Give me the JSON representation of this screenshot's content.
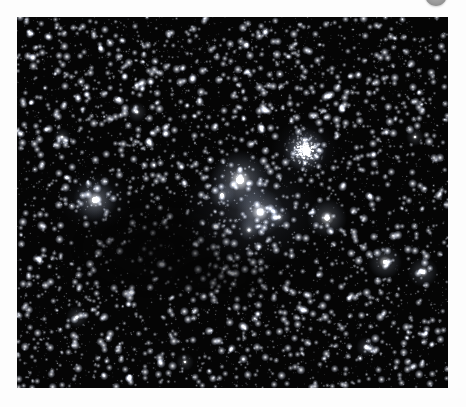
{
  "page": {
    "background_color": "#fdfdfd"
  },
  "avatar_badge": {
    "name": "avatar-badge",
    "shape": "circle",
    "color": "#9a9a9a",
    "clipped": "top"
  },
  "sky_image": {
    "alt": "Dense Milky Way star field with globular cluster and dark nebulae",
    "background_color": "#050505",
    "frame": {
      "x": 17,
      "y": 17,
      "width": 431,
      "height": 371
    },
    "star_color": "#ffffff",
    "chart_data": {
      "type": "scatter",
      "title": "",
      "xlabel": "",
      "ylabel": "",
      "xlim": [
        0,
        431
      ],
      "ylim": [
        0,
        371
      ],
      "grid": false,
      "legend": null,
      "background": "#050505",
      "field_seed": 20240617,
      "star_count": 5200,
      "density_regions": [
        {
          "name": "upper-field-dense",
          "cx": 215,
          "cy": 55,
          "rx": 230,
          "ry": 70,
          "density": 1.45
        },
        {
          "name": "mid-field",
          "cx": 215,
          "cy": 185,
          "rx": 230,
          "ry": 110,
          "density": 1.0
        },
        {
          "name": "dark-nebula-core",
          "cx": 135,
          "cy": 230,
          "rx": 105,
          "ry": 62,
          "density": 0.32
        },
        {
          "name": "dark-nebula-lane",
          "cx": 215,
          "cy": 250,
          "rx": 150,
          "ry": 45,
          "density": 0.45
        },
        {
          "name": "lower-field",
          "cx": 215,
          "cy": 320,
          "rx": 230,
          "ry": 70,
          "density": 1.15
        }
      ],
      "bright_stars": [
        {
          "name": "star-alpha",
          "x": 223,
          "y": 163,
          "r": 7.5,
          "brightness": 1.0,
          "halo": 30
        },
        {
          "name": "star-beta",
          "x": 243,
          "y": 195,
          "r": 6.0,
          "brightness": 0.92,
          "halo": 24
        },
        {
          "name": "star-gamma",
          "x": 78,
          "y": 183,
          "r": 5.5,
          "brightness": 0.88,
          "halo": 22
        },
        {
          "name": "star-delta",
          "x": 310,
          "y": 201,
          "r": 5.0,
          "brightness": 0.85,
          "halo": 20
        },
        {
          "name": "star-epsilon",
          "x": 368,
          "y": 245,
          "r": 4.2,
          "brightness": 0.78,
          "halo": 17
        },
        {
          "name": "star-zeta",
          "x": 406,
          "y": 255,
          "r": 3.8,
          "brightness": 0.74,
          "halo": 15
        },
        {
          "name": "star-eta",
          "x": 205,
          "y": 178,
          "r": 3.4,
          "brightness": 0.7,
          "halo": 13
        },
        {
          "name": "star-theta",
          "x": 262,
          "y": 200,
          "r": 3.2,
          "brightness": 0.68,
          "halo": 12
        },
        {
          "name": "star-iota",
          "x": 232,
          "y": 213,
          "r": 3.0,
          "brightness": 0.65,
          "halo": 11
        },
        {
          "name": "star-kappa",
          "x": 60,
          "y": 300,
          "r": 3.0,
          "brightness": 0.64,
          "halo": 11
        },
        {
          "name": "star-lambda",
          "x": 349,
          "y": 330,
          "r": 2.8,
          "brightness": 0.62,
          "halo": 10
        },
        {
          "name": "star-mu",
          "x": 120,
          "y": 95,
          "r": 2.8,
          "brightness": 0.6,
          "halo": 10
        },
        {
          "name": "star-nu",
          "x": 398,
          "y": 120,
          "r": 2.6,
          "brightness": 0.58,
          "halo": 9
        },
        {
          "name": "star-xi",
          "x": 45,
          "y": 120,
          "r": 2.6,
          "brightness": 0.58,
          "halo": 9
        },
        {
          "name": "star-omicron",
          "x": 168,
          "y": 345,
          "r": 2.5,
          "brightness": 0.56,
          "halo": 9
        }
      ],
      "globular_cluster": {
        "name": "globular-cluster",
        "x": 288,
        "y": 133,
        "core_radius": 9,
        "halo_radius": 22,
        "member_stars": 260,
        "brightness": 0.95
      },
      "nebulosity": [
        {
          "name": "nebula-glow-central",
          "cx": 235,
          "cy": 195,
          "rx": 70,
          "ry": 55,
          "opacity": 0.2
        },
        {
          "name": "nebula-glow-cluster",
          "cx": 288,
          "cy": 133,
          "rx": 34,
          "ry": 30,
          "opacity": 0.16
        },
        {
          "name": "nebula-glow-left",
          "cx": 78,
          "cy": 183,
          "rx": 36,
          "ry": 30,
          "opacity": 0.14
        }
      ],
      "dark_nebulae": [
        {
          "name": "dark-nebula-main",
          "cx": 140,
          "cy": 232,
          "rx": 98,
          "ry": 56,
          "opacity": 0.72
        },
        {
          "name": "dark-nebula-lower",
          "cx": 212,
          "cy": 262,
          "rx": 78,
          "ry": 34,
          "opacity": 0.5
        }
      ]
    }
  }
}
